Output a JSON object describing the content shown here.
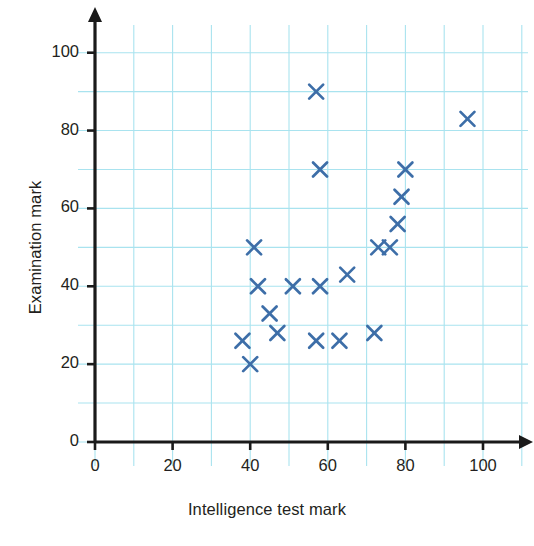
{
  "chart_data": {
    "type": "scatter",
    "title": "",
    "xlabel": "Intelligence test mark",
    "ylabel": "Examination mark",
    "xlim": [
      0,
      100
    ],
    "ylim": [
      0,
      100
    ],
    "xticks": [
      0,
      20,
      40,
      60,
      80,
      100
    ],
    "yticks": [
      0,
      20,
      40,
      60,
      80,
      100
    ],
    "xtick_labels": [
      "0",
      "20",
      "40",
      "60",
      "80",
      "100"
    ],
    "ytick_labels": [
      "0",
      "20",
      "40",
      "60",
      "80",
      "100"
    ],
    "grid": true,
    "grid_minor_step": 10,
    "grid_color": "#a9e3ef",
    "marker": "x",
    "marker_color": "#3d6ea8",
    "axis_color": "#1a1a1a",
    "legend": null,
    "points": [
      {
        "x": 38,
        "y": 26
      },
      {
        "x": 40,
        "y": 20
      },
      {
        "x": 41,
        "y": 50
      },
      {
        "x": 42,
        "y": 40
      },
      {
        "x": 45,
        "y": 33
      },
      {
        "x": 47,
        "y": 28
      },
      {
        "x": 51,
        "y": 40
      },
      {
        "x": 57,
        "y": 90
      },
      {
        "x": 57,
        "y": 26
      },
      {
        "x": 58,
        "y": 40
      },
      {
        "x": 58,
        "y": 70
      },
      {
        "x": 63,
        "y": 26
      },
      {
        "x": 65,
        "y": 43
      },
      {
        "x": 72,
        "y": 28
      },
      {
        "x": 73,
        "y": 50
      },
      {
        "x": 76,
        "y": 50
      },
      {
        "x": 78,
        "y": 56
      },
      {
        "x": 79,
        "y": 63
      },
      {
        "x": 80,
        "y": 70
      },
      {
        "x": 96,
        "y": 83
      }
    ]
  },
  "figure": {
    "caption": ""
  }
}
